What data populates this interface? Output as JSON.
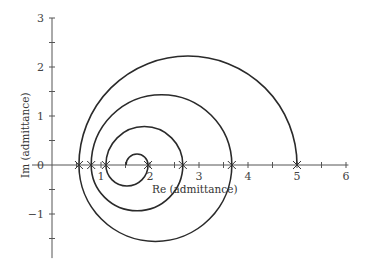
{
  "chart_data": {
    "type": "line",
    "title": "",
    "xlabel": "Re (admittance)",
    "ylabel": "Im (admittance)",
    "xlim": [
      0,
      6
    ],
    "ylim": [
      -1.9,
      3
    ],
    "x_ticks": [
      1,
      2,
      3,
      4,
      5,
      6
    ],
    "y_ticks": [
      3,
      2,
      1,
      0,
      -1
    ],
    "x_minor_step": 0.5,
    "y_minor_step": 0.5,
    "grid": false,
    "legend": null,
    "series": [
      {
        "name": "admittance spiral",
        "description": "Spiral of alternating semicircles centered on the real axis, winding outward from about 1.5 to 5.0",
        "arcs": [
          {
            "from": 1.51,
            "to": 1.96,
            "side": "upper"
          },
          {
            "from": 1.96,
            "to": 1.1,
            "side": "lower"
          },
          {
            "from": 1.1,
            "to": 2.67,
            "side": "upper"
          },
          {
            "from": 2.67,
            "to": 0.8,
            "side": "lower"
          },
          {
            "from": 0.8,
            "to": 3.67,
            "side": "upper"
          },
          {
            "from": 3.67,
            "to": 0.55,
            "side": "lower"
          },
          {
            "from": 0.55,
            "to": 5.0,
            "side": "upper"
          }
        ],
        "peak_values": {
          "upper_max_im": [
            0.23,
            0.785,
            1.435,
            2.225
          ],
          "lower_min_im": [
            -0.43,
            -0.935,
            -1.56
          ]
        }
      }
    ],
    "markers": {
      "symbol": "x",
      "re_values": [
        0.55,
        0.8,
        1.1,
        1.96,
        2.67,
        3.67,
        5.0
      ],
      "im_values": [
        0,
        0,
        0,
        0,
        0,
        0,
        0
      ]
    }
  },
  "axes": {
    "x_label": "Re (admittance)",
    "y_label": "Im (admittance)",
    "x_tick_labels": [
      "1",
      "2",
      "3",
      "4",
      "5",
      "6"
    ],
    "y_tick_labels": [
      "3",
      "2",
      "1",
      "0",
      "−1"
    ]
  },
  "colors": {
    "curve": "#2a2a2a",
    "axis": "#555555",
    "marker": "#333333"
  }
}
